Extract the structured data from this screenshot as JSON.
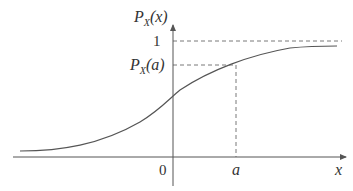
{
  "diagram": {
    "y_axis_label_main": "P",
    "y_axis_label_sub": "X",
    "y_axis_label_arg": "(x)",
    "x_axis_label": "x",
    "origin_label": "0",
    "a_label": "a",
    "one_label": "1",
    "pa_label_main": "P",
    "pa_label_sub": "X",
    "pa_label_arg": "(a)",
    "colors": {
      "curve": "#555555",
      "axis": "#555555",
      "dashed": "#555555"
    }
  }
}
